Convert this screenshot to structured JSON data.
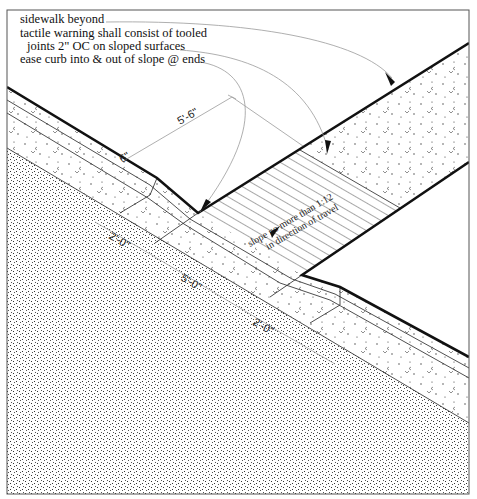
{
  "drawing": {
    "title": "Curb ramp detail (plan view)",
    "notes": [
      {
        "text": "sidewalk beyond",
        "x": 20,
        "y": 19
      },
      {
        "text": "tactile warning shall consist of tooled",
        "x": 20,
        "y": 33
      },
      {
        "text": "joints 2\" OC on sloped surfaces",
        "x": 27,
        "y": 46
      },
      {
        "text": "ease curb into & out of slope @ ends",
        "x": 20,
        "y": 59
      }
    ],
    "dimensions": {
      "ramp_width": "5'-6\"",
      "curb_offset": "6\"",
      "flare_left": "2'-0\"",
      "ramp_length": "5'-0\"",
      "flare_right": "2'-0\""
    },
    "ramp_label": {
      "line1": "slope no more than 1:12",
      "line2": "in direction of travel"
    },
    "colors": {
      "line": "#111111",
      "leader": "#9a9a9a",
      "frame": "#555555",
      "background": "#ffffff"
    }
  }
}
